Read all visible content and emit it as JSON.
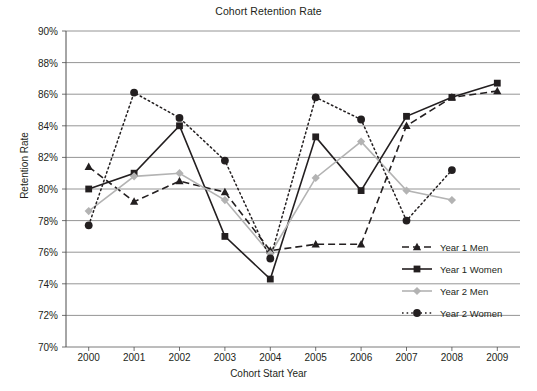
{
  "chart_data": {
    "type": "line",
    "title": "Cohort Retention Rate",
    "xlabel": "Cohort Start Year",
    "ylabel": "Retention Rate",
    "categories": [
      "2000",
      "2001",
      "2002",
      "2003",
      "2004",
      "2005",
      "2006",
      "2007",
      "2008",
      "2009"
    ],
    "ylim": [
      70,
      90
    ],
    "ytick_labels": [
      "70%",
      "72%",
      "74%",
      "76%",
      "78%",
      "80%",
      "82%",
      "84%",
      "86%",
      "88%",
      "90%"
    ],
    "ytick_values": [
      70,
      72,
      74,
      76,
      78,
      80,
      82,
      84,
      86,
      88,
      90
    ],
    "grid": true,
    "legend_position": "bottom-right",
    "series": [
      {
        "name": "Year 1 Men",
        "marker": "triangle",
        "dash": "dashed",
        "color": "#231f20",
        "values": [
          81.4,
          79.2,
          80.5,
          79.8,
          76.1,
          76.5,
          76.5,
          84.0,
          85.8,
          86.2
        ]
      },
      {
        "name": "Year 1 Women",
        "marker": "square",
        "dash": "solid",
        "color": "#231f20",
        "values": [
          80.0,
          81.0,
          84.0,
          77.0,
          74.3,
          83.3,
          79.9,
          84.6,
          85.8,
          86.7
        ]
      },
      {
        "name": "Year 2 Men",
        "marker": "diamond",
        "dash": "solid",
        "color": "#b3b3b3",
        "values": [
          78.6,
          80.8,
          81.0,
          79.3,
          75.9,
          80.7,
          83.0,
          79.9,
          79.3,
          null
        ]
      },
      {
        "name": "Year 2 Women",
        "marker": "circle",
        "dash": "dotted",
        "color": "#231f20",
        "values": [
          77.7,
          86.1,
          84.5,
          81.8,
          75.6,
          85.8,
          84.4,
          78.0,
          81.2,
          null
        ]
      }
    ]
  }
}
